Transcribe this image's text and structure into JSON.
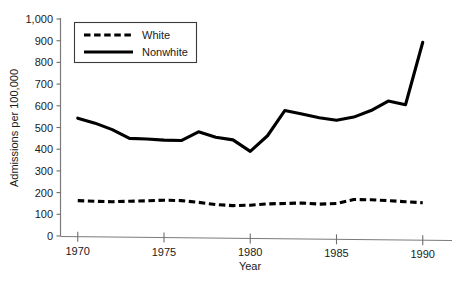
{
  "chart_data": {
    "type": "line",
    "title": "",
    "xlabel": "Year",
    "ylabel": "Admissions per 100,000",
    "xlim": [
      1969,
      1991
    ],
    "ylim": [
      0,
      1000
    ],
    "grid": false,
    "legend_position": "top-left",
    "x": [
      1970,
      1971,
      1972,
      1973,
      1974,
      1975,
      1976,
      1977,
      1978,
      1979,
      1980,
      1981,
      1982,
      1983,
      1984,
      1985,
      1986,
      1987,
      1988,
      1989,
      1990
    ],
    "xticks": [
      1970,
      1975,
      1980,
      1985,
      1990
    ],
    "xtick_labels": [
      "1970",
      "1975",
      "1980",
      "1985",
      "1990"
    ],
    "yticks": [
      0,
      100,
      200,
      300,
      400,
      500,
      600,
      700,
      800,
      900,
      1000
    ],
    "ytick_labels": [
      "0",
      "100",
      "200",
      "300",
      "400",
      "500",
      "600",
      "700",
      "800",
      "900",
      "1,000"
    ],
    "series": [
      {
        "name": "White",
        "style": "dashed",
        "color": "#000000",
        "values": [
          163,
          160,
          158,
          160,
          162,
          165,
          163,
          155,
          145,
          140,
          142,
          148,
          150,
          152,
          147,
          150,
          168,
          167,
          163,
          158,
          153
        ]
      },
      {
        "name": "Nonwhite",
        "style": "solid",
        "color": "#000000",
        "values": [
          543,
          520,
          490,
          450,
          447,
          442,
          440,
          480,
          455,
          443,
          390,
          462,
          578,
          562,
          545,
          533,
          548,
          578,
          622,
          605,
          700
        ]
      }
    ],
    "series_note_last_point": 893
  },
  "legend": {
    "items": [
      {
        "label": "White",
        "style": "dashed"
      },
      {
        "label": "Nonwhite",
        "style": "solid"
      }
    ]
  },
  "axes": {
    "x_title": "Year",
    "y_title": "Admissions per 100,000"
  }
}
